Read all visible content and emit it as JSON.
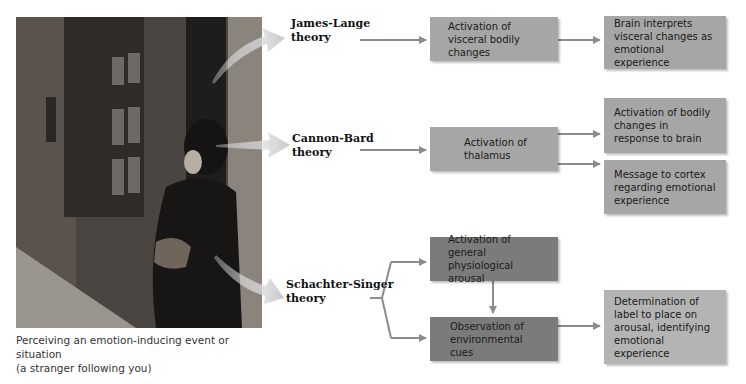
{
  "photo": {
    "description": "Woman in dark coat looking over her shoulder in a brick alley",
    "caption_line1": "Perceiving an emotion-inducing event or situation",
    "caption_line2": "(a stranger following you)"
  },
  "theories": [
    {
      "name_line1": "James-Lange",
      "name_line2": "theory",
      "steps": [
        "Activation of visceral bodily changes"
      ],
      "outcomes": [
        "Brain interprets visceral changes as emotional experience"
      ]
    },
    {
      "name_line1": "Cannon-Bard",
      "name_line2": "theory",
      "steps": [
        "Activation of thalamus"
      ],
      "outcomes": [
        "Activation of bodily changes in response to brain",
        "Message to cortex regarding emotional experience"
      ]
    },
    {
      "name_line1": "Schachter-Singer",
      "name_line2": "theory",
      "steps": [
        "Activation of general physiological arousal",
        "Observation of environmental cues"
      ],
      "outcomes": [
        "Determination of label to place on arousal, identifying emotional experience"
      ]
    }
  ],
  "colors": {
    "box_mid": "#a6a6a6",
    "box_dark": "#7b7b7b",
    "box_light": "#b4b4b4",
    "arrow": "#8c8c8c"
  }
}
